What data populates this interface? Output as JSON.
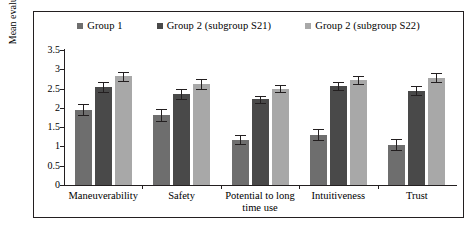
{
  "chart_data": {
    "type": "bar",
    "title": "",
    "subtitle": "",
    "xlabel": "",
    "ylabel": "Mean evaluation score",
    "ylim": [
      0,
      3.5
    ],
    "ytick_labels": [
      "0",
      "0.5",
      "1",
      "1.5",
      "2",
      "2.5",
      "3",
      "3.5"
    ],
    "ytick_values": [
      0,
      0.5,
      1,
      1.5,
      2,
      2.5,
      3,
      3.5
    ],
    "grid": false,
    "legend_position": "top-center",
    "error_bars": true,
    "categories": [
      "Maneuverability",
      "Safety",
      "Potential to long time use",
      "Intuitiveness",
      "Trust"
    ],
    "series": [
      {
        "name": "Group 1",
        "color": "#6e6e6e",
        "values": [
          1.95,
          1.82,
          1.18,
          1.3,
          1.05
        ],
        "errors": [
          0.14,
          0.15,
          0.12,
          0.14,
          0.15
        ]
      },
      {
        "name": "Group 2 (subgroup S21)",
        "color": "#494949",
        "values": [
          2.54,
          2.36,
          2.22,
          2.56,
          2.45
        ],
        "errors": [
          0.13,
          0.13,
          0.1,
          0.11,
          0.12
        ]
      },
      {
        "name": "Group 2 (subgroup S22)",
        "color": "#a8a8a8",
        "values": [
          2.82,
          2.62,
          2.5,
          2.72,
          2.78
        ],
        "errors": [
          0.12,
          0.12,
          0.1,
          0.11,
          0.12
        ]
      }
    ]
  },
  "legend": {
    "items": [
      {
        "label": "Group 1",
        "color": "#6e6e6e"
      },
      {
        "label": "Group 2 (subgroup S21)",
        "color": "#494949"
      },
      {
        "label": "Group 2 (subgroup S22)",
        "color": "#a8a8a8"
      }
    ]
  },
  "axes": {
    "y_title": "Mean evaluation score"
  },
  "colors": {
    "axis": "#231f20",
    "frame": "#231f20",
    "background": "#ffffff"
  }
}
